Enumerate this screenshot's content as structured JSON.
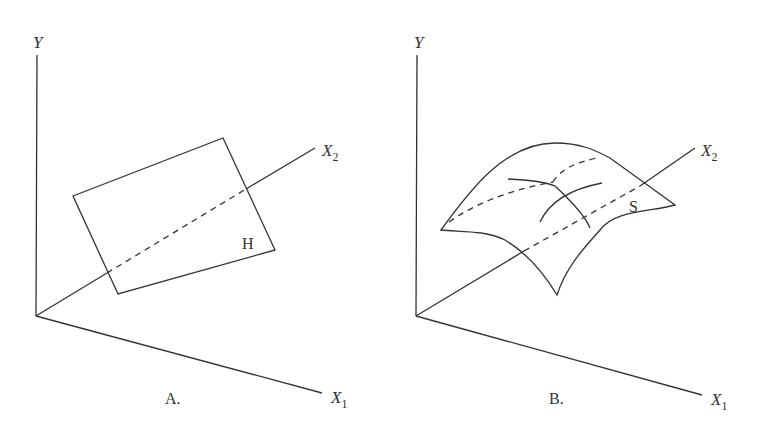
{
  "figure": {
    "panels": [
      {
        "id": "A",
        "caption": "A.",
        "axes": {
          "y": "Y",
          "x1": "X",
          "x1_sub": "1",
          "x2": "X",
          "x2_sub": "2"
        },
        "shape": "plane",
        "shape_label": "H"
      },
      {
        "id": "B",
        "caption": "B.",
        "axes": {
          "y": "Y",
          "x1": "X",
          "x1_sub": "1",
          "x2": "X",
          "x2_sub": "2"
        },
        "shape": "curved surface",
        "shape_label": "S"
      }
    ]
  }
}
